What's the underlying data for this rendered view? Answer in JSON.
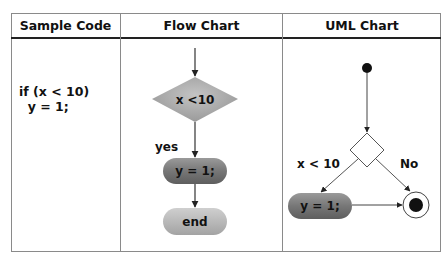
{
  "table": {
    "headers": [
      "Sample Code",
      "Flow Chart",
      "UML Chart"
    ]
  },
  "sample_code": {
    "line1": "if (x < 10)",
    "line2": "  y = 1;"
  },
  "flow_chart": {
    "decision_label": "x <10",
    "branch_label": "yes",
    "action_label": "y = 1;",
    "end_label": "end"
  },
  "uml_chart": {
    "branch_true_label": "x < 10",
    "branch_false_label": "No",
    "action_label": "y = 1;"
  },
  "colors": {
    "diamond_fill": "#a9a9a9",
    "action_fill": "#7a7a7a",
    "end_fill": "#b5b5b5",
    "line": "#333333"
  }
}
